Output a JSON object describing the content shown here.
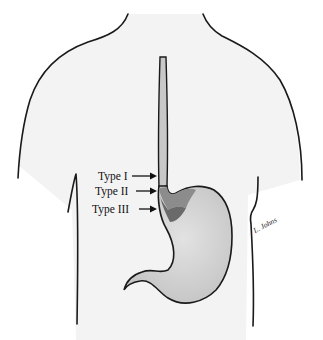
{
  "figure": {
    "labels": [
      {
        "id": "type1",
        "text": "Type I"
      },
      {
        "id": "type2",
        "text": "Type II"
      },
      {
        "id": "type3",
        "text": "Type III"
      }
    ],
    "signature": "L. Johns",
    "colors": {
      "body_fill": "#f4f4f4",
      "esophagus_fill": "#c8c8c8",
      "stomach_fill": "#d2d2d2",
      "type2_region": "#8a8a8a",
      "type3_region": "#6a6a6a",
      "outline": "#1a1a1a"
    }
  }
}
